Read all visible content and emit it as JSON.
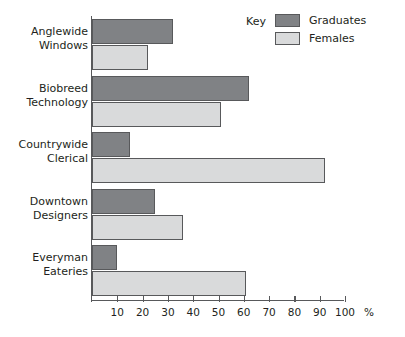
{
  "legend": {
    "title": "Key",
    "entries": [
      {
        "label": "Graduates",
        "color": "#808285"
      },
      {
        "label": "Females",
        "color": "#d9dadb"
      }
    ]
  },
  "axis": {
    "unit": "%",
    "ticks": [
      "10",
      "20",
      "30",
      "40",
      "50",
      "60",
      "70",
      "80",
      "90",
      "100"
    ]
  },
  "categories": [
    {
      "line1": "Anglewide",
      "line2": "Windows"
    },
    {
      "line1": "Biobreed",
      "line2": "Technology"
    },
    {
      "line1": "Countrywide",
      "line2": "Clerical"
    },
    {
      "line1": "Downtown",
      "line2": "Designers"
    },
    {
      "line1": "Everyman",
      "line2": "Eateries"
    }
  ],
  "chart_data": {
    "type": "bar",
    "orientation": "horizontal",
    "title": "",
    "xlabel": "%",
    "ylabel": "",
    "xlim": [
      0,
      100
    ],
    "xticks": [
      10,
      20,
      30,
      40,
      50,
      60,
      70,
      80,
      90,
      100
    ],
    "grid": false,
    "legend_position": "top-right",
    "legend_title": "Key",
    "categories": [
      "Anglewide Windows",
      "Biobreed Technology",
      "Countrywide Clerical",
      "Downtown Designers",
      "Everyman Eateries"
    ],
    "series": [
      {
        "name": "Graduates",
        "color": "#808285",
        "values": [
          32,
          62,
          15,
          25,
          10
        ]
      },
      {
        "name": "Females",
        "color": "#d9dadb",
        "values": [
          22,
          51,
          92,
          36,
          61
        ]
      }
    ]
  }
}
